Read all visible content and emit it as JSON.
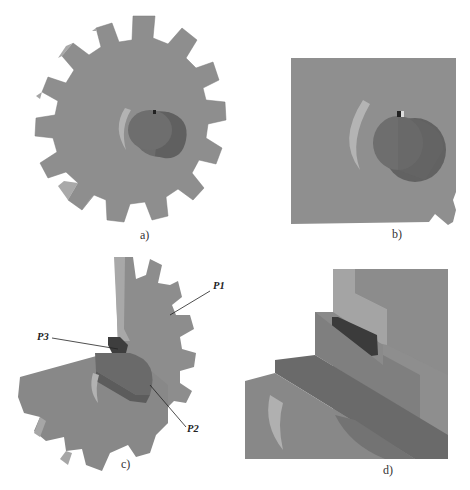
{
  "figure": {
    "panels": [
      {
        "id": "a",
        "caption": "a)",
        "description": "Spur gear with shaft, isometric view"
      },
      {
        "id": "b",
        "caption": "b)",
        "description": "Close-up of gear hub with shaft and keyway"
      },
      {
        "id": "c",
        "caption": "c)",
        "description": "Sectioned gear assembly with labeled parts"
      },
      {
        "id": "d",
        "caption": "d)",
        "description": "Close-up of key in keyway section"
      }
    ],
    "callouts": {
      "p1": "P1",
      "p2": "P2",
      "p3": "P3"
    },
    "colors": {
      "gear_face": "#8e8e8e",
      "gear_side": "#a9a9a9",
      "gear_edge": "#6f6f6f",
      "shaft_front": "#6e6e6e",
      "shaft_side": "#5e5e5e",
      "key_dark": "#3a3a3a",
      "highlight": "#c4c4c4"
    }
  }
}
